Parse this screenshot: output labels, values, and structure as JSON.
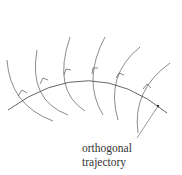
{
  "diagram": {
    "label": {
      "line1": "orthogonal",
      "line2": "trajectory"
    },
    "colors": {
      "stroke": "#6e6e6e",
      "trajectory": "#555555",
      "text": "#333333",
      "background": "#ffffff"
    },
    "trajectory": {
      "path": "M 8 110 Q 90 50 167 113"
    },
    "family_curves": [
      {
        "path": "M 7 60 Q 10 105 53 121"
      },
      {
        "path": "M 37 50 Q 28 100 68 115"
      },
      {
        "path": "M 70 37 Q 52 90 85 111"
      },
      {
        "path": "M 105 37 Q 82 80 103 115"
      },
      {
        "path": "M 140 47 Q 105 75 118 120"
      },
      {
        "path": "M 170 63 Q 132 90 138 133"
      }
    ],
    "right_angle_marks": [
      {
        "path": "M 18 96 L 22 90 L 27 93"
      },
      {
        "path": "M 40 84 L 43 78 L 48 80"
      },
      {
        "path": "M 64 75 L 66 69 L 71 70"
      },
      {
        "path": "M 92 74 L 93 68 L 98 68"
      },
      {
        "path": "M 116 78 L 119 73 L 124 75"
      },
      {
        "path": "M 143 89 L 147 84 L 151 88"
      }
    ],
    "arrow": {
      "from": [
        137,
        138
      ],
      "to": [
        158,
        106
      ],
      "dot": [
        158,
        106
      ]
    }
  }
}
